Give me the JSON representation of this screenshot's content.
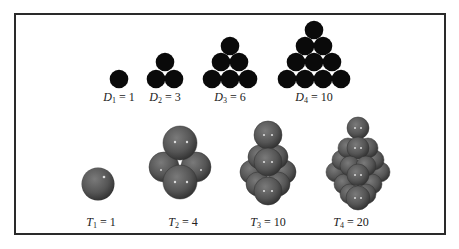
{
  "figure": {
    "top_row_title": "Triangular numbers (2D disk packings)",
    "bottom_row_title": "Tetrahedral numbers (3D sphere packings)",
    "colors": {
      "disk": "#0a0a0a",
      "sphere": "#555555",
      "sphere_dark": "#2e2e2e",
      "frame": "#2a2a2a"
    },
    "triangular": [
      {
        "sym": "D",
        "sub": "1",
        "val": "1"
      },
      {
        "sym": "D",
        "sub": "2",
        "val": "3"
      },
      {
        "sym": "D",
        "sub": "3",
        "val": "6"
      },
      {
        "sym": "D",
        "sub": "4",
        "val": "10"
      }
    ],
    "tetrahedral": [
      {
        "sym": "T",
        "sub": "1",
        "val": "1"
      },
      {
        "sym": "T",
        "sub": "2",
        "val": "4"
      },
      {
        "sym": "T",
        "sub": "3",
        "val": "10"
      },
      {
        "sym": "T",
        "sub": "4",
        "val": "20"
      }
    ]
  }
}
